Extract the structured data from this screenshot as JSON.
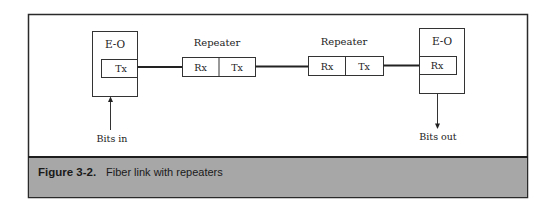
{
  "figure": {
    "caption_number": "Figure 3-2.",
    "caption_text": "Fiber link with repeaters",
    "colors": {
      "caption_bar": "#a7a7a7",
      "frame": "#2a2a2a",
      "line": "#222222",
      "background": "#ffffff"
    }
  },
  "diagram": {
    "transmitter": {
      "label": "E-O",
      "port": "Tx",
      "input_label": "Bits in"
    },
    "repeaters": [
      {
        "label": "Repeater",
        "rx": "Rx",
        "tx": "Tx"
      },
      {
        "label": "Repeater",
        "rx": "Rx",
        "tx": "Tx"
      }
    ],
    "receiver": {
      "label": "E-O",
      "port": "Rx",
      "output_label": "Bits out"
    }
  }
}
